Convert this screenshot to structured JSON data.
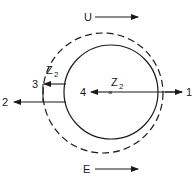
{
  "diagram": {
    "type": "flow-around-cylinder",
    "labels": {
      "top_flow": "U",
      "bottom_field": "E",
      "outer_zone_symbol": "Z",
      "outer_zone_subscript": "2",
      "center_symbol": "Z",
      "center_subscript": "2",
      "point_1": "1",
      "point_2": "2",
      "point_3": "3",
      "point_4": "4"
    },
    "shapes": {
      "inner_circle": {
        "cx": 111,
        "cy": 92,
        "r": 47,
        "style": "solid"
      },
      "outer_circle": {
        "cx": 103,
        "cy": 93,
        "r": 60,
        "style": "dashed"
      }
    },
    "colors": {
      "stroke": "#1a1a1a",
      "background": "#ffffff"
    }
  }
}
